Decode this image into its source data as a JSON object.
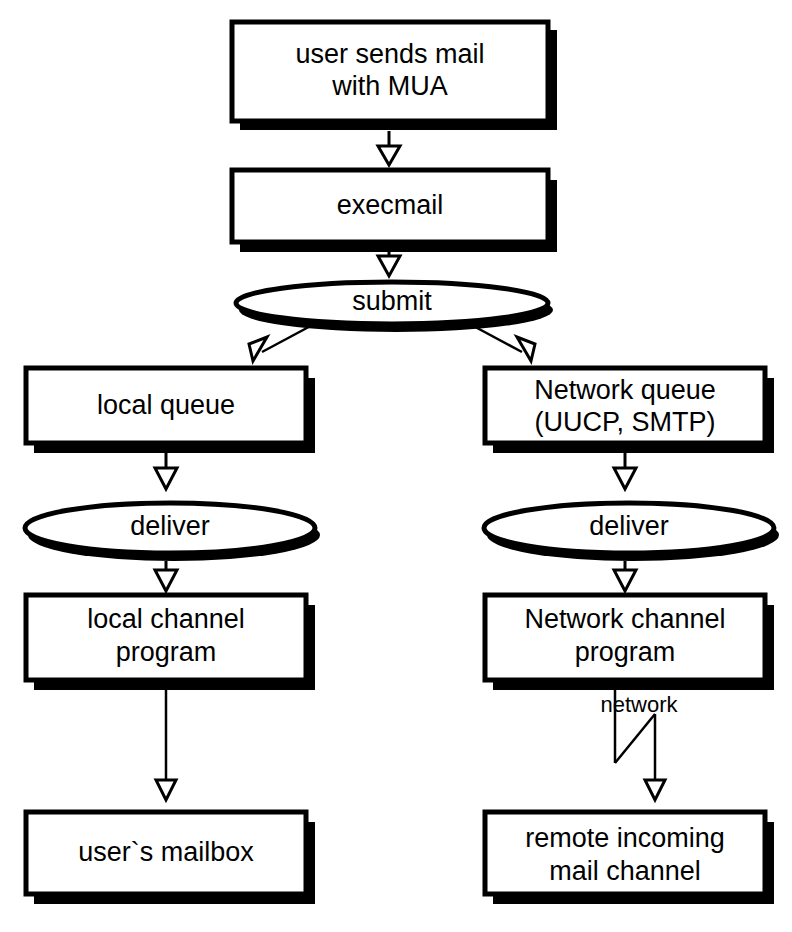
{
  "diagram": {
    "background_color": "#ffffff",
    "stroke_color": "#000000",
    "shadow_color": "#000000",
    "nodes": {
      "user_sends_mail": {
        "line1": "user sends mail",
        "line2": "with MUA",
        "shape": "box"
      },
      "execmail": {
        "line1": "execmail",
        "shape": "box"
      },
      "submit": {
        "line1": "submit",
        "shape": "ellipse"
      },
      "local_queue": {
        "line1": "local queue",
        "shape": "box"
      },
      "network_queue": {
        "line1": "Network queue",
        "line2": "(UUCP, SMTP)",
        "shape": "box"
      },
      "deliver_left": {
        "line1": "deliver",
        "shape": "ellipse"
      },
      "deliver_right": {
        "line1": "deliver",
        "shape": "ellipse"
      },
      "local_channel_program": {
        "line1": "local channel",
        "line2": "program",
        "shape": "box"
      },
      "network_channel_program": {
        "line1": "Network channel",
        "line2": "program",
        "shape": "box"
      },
      "users_mailbox": {
        "line1": "user`s mailbox",
        "shape": "box"
      },
      "remote_incoming": {
        "line1": "remote incoming",
        "line2": "mail channel",
        "shape": "box"
      }
    },
    "annotations": {
      "network": "network"
    }
  }
}
